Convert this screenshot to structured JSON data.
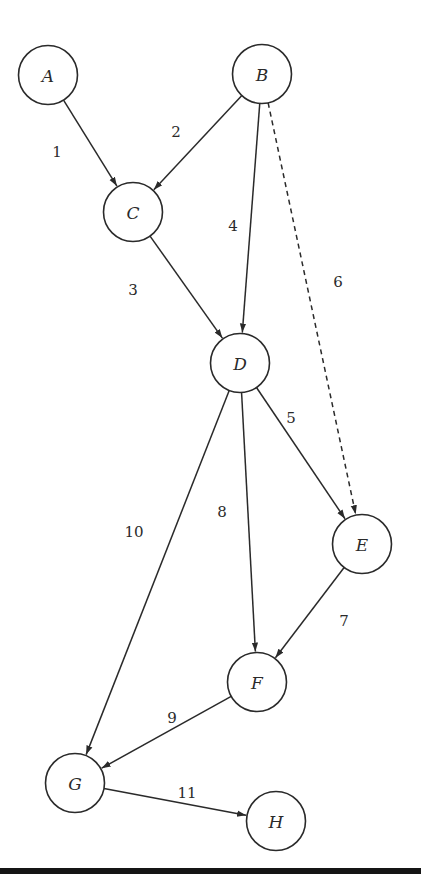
{
  "diagram": {
    "type": "directed-graph",
    "node_radius": 29.5,
    "stroke_color": "#2a2a2a",
    "nodes": [
      {
        "id": "A",
        "label": "A",
        "x": 48,
        "y": 75
      },
      {
        "id": "B",
        "label": "B",
        "x": 262,
        "y": 74
      },
      {
        "id": "C",
        "label": "C",
        "x": 133,
        "y": 212
      },
      {
        "id": "D",
        "label": "D",
        "x": 240,
        "y": 363
      },
      {
        "id": "E",
        "label": "E",
        "x": 362,
        "y": 544
      },
      {
        "id": "F",
        "label": "F",
        "x": 257,
        "y": 682
      },
      {
        "id": "G",
        "label": "G",
        "x": 75,
        "y": 783
      },
      {
        "id": "H",
        "label": "H",
        "x": 276,
        "y": 821
      }
    ],
    "edges": [
      {
        "label": "1",
        "from": "A",
        "to": "C",
        "style": "solid",
        "lx": 57,
        "ly": 152
      },
      {
        "label": "2",
        "from": "B",
        "to": "C",
        "style": "solid",
        "lx": 176,
        "ly": 132
      },
      {
        "label": "3",
        "from": "C",
        "to": "D",
        "style": "solid",
        "lx": 133,
        "ly": 290
      },
      {
        "label": "4",
        "from": "B",
        "to": "D",
        "style": "solid",
        "lx": 233,
        "ly": 226
      },
      {
        "label": "5",
        "from": "D",
        "to": "E",
        "style": "solid",
        "lx": 291,
        "ly": 418
      },
      {
        "label": "6",
        "from": "B",
        "to": "E",
        "style": "dashed",
        "lx": 338,
        "ly": 282
      },
      {
        "label": "7",
        "from": "E",
        "to": "F",
        "style": "solid",
        "lx": 344,
        "ly": 621
      },
      {
        "label": "8",
        "from": "D",
        "to": "F",
        "style": "solid",
        "lx": 222,
        "ly": 512
      },
      {
        "label": "9",
        "from": "F",
        "to": "G",
        "style": "solid",
        "lx": 172,
        "ly": 718
      },
      {
        "label": "10",
        "from": "D",
        "to": "G",
        "style": "solid",
        "lx": 134,
        "ly": 532
      },
      {
        "label": "11",
        "from": "G",
        "to": "H",
        "style": "solid",
        "lx": 187,
        "ly": 793
      }
    ]
  }
}
